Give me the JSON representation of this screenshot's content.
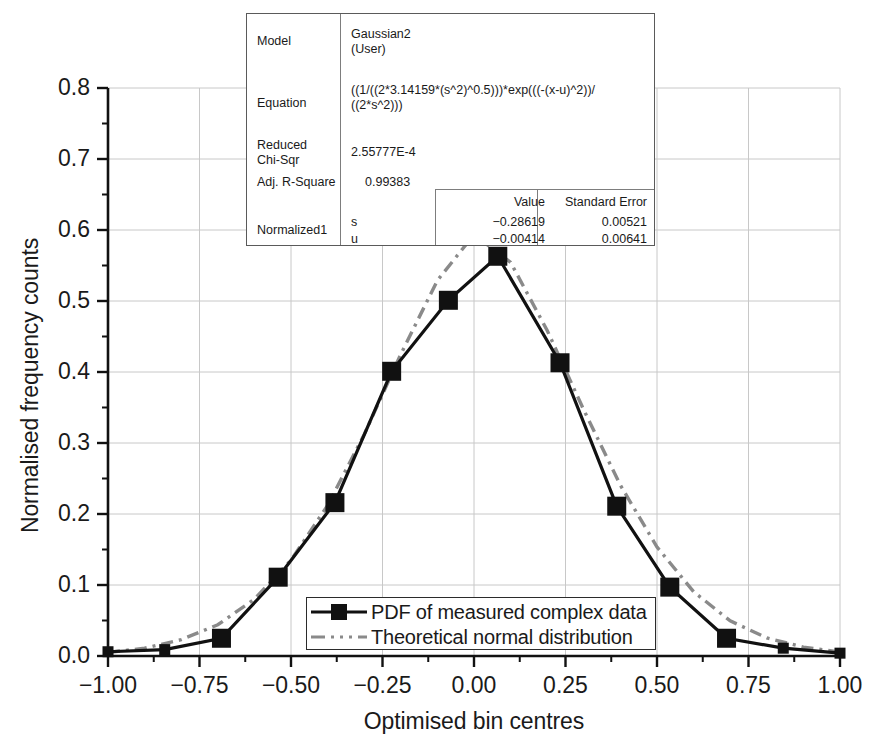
{
  "chart_data": {
    "type": "line",
    "title": "",
    "xlabel": "Optimised bin centres",
    "ylabel": "Normalised frequency counts",
    "xlim": [
      -1.0,
      1.0
    ],
    "ylim": [
      0.0,
      0.8
    ],
    "xticks": [
      "-1.00",
      "-0.75",
      "-0.50",
      "-0.25",
      "0.00",
      "0.25",
      "0.50",
      "0.75",
      "1.00"
    ],
    "xtick_values": [
      -1.0,
      -0.75,
      -0.5,
      -0.25,
      0.0,
      0.25,
      0.5,
      0.75,
      1.0
    ],
    "yticks": [
      "0.0",
      "0.1",
      "0.2",
      "0.3",
      "0.4",
      "0.5",
      "0.6",
      "0.7",
      "0.8"
    ],
    "ytick_values": [
      0.0,
      0.1,
      0.2,
      0.3,
      0.4,
      0.5,
      0.6,
      0.7,
      0.8
    ],
    "minor_ticks": true,
    "grid": true,
    "grid_color": "#c8c8c8",
    "legend_position": "lower center",
    "series": [
      {
        "name": "PDF of measured complex data",
        "style": "solid-line-with-square-markers",
        "color": "#111111",
        "x": [
          -1.0,
          -0.845,
          -0.69,
          -0.535,
          -0.38,
          -0.225,
          -0.07,
          0.065,
          0.235,
          0.39,
          0.535,
          0.69,
          0.845,
          1.0
        ],
        "y": [
          0.006,
          0.009,
          0.025,
          0.111,
          0.216,
          0.401,
          0.501,
          0.563,
          0.413,
          0.211,
          0.097,
          0.025,
          0.011,
          0.004
        ]
      },
      {
        "name": "Theoretical normal distribution",
        "style": "dash-dot-line",
        "color": "#8a8a8a",
        "x": [
          -1.0,
          -0.9,
          -0.8,
          -0.7,
          -0.6,
          -0.5,
          -0.4,
          -0.3,
          -0.2,
          -0.1,
          0.0,
          0.1,
          0.2,
          0.3,
          0.4,
          0.5,
          0.6,
          0.7,
          0.8,
          0.9,
          1.0
        ],
        "y": [
          0.005,
          0.011,
          0.023,
          0.044,
          0.08,
          0.135,
          0.212,
          0.312,
          0.425,
          0.529,
          0.5935,
          0.5545,
          0.4585,
          0.3465,
          0.2405,
          0.1535,
          0.0905,
          0.0495,
          0.0255,
          0.0125,
          0.0055
        ]
      }
    ],
    "fit_box": {
      "rows": [
        {
          "label": "Model",
          "value": "Gaussian2\n(User)"
        },
        {
          "label": "Equation",
          "value": "((1/((2*3.14159*(s^2)^0.5)))*exp(((-(x-u)^2))/\n((2*s^2)))"
        },
        {
          "label": "Reduced\nChi-Sqr",
          "value": "2.55777E-4"
        },
        {
          "label": "Adj. R-Square",
          "value": "0.99383"
        }
      ],
      "param_header": {
        "value_label": "Value",
        "error_label": "Standard Error"
      },
      "param_group": "Normalized1",
      "params": [
        {
          "name": "s",
          "value": "−0.28619",
          "error": "0.00521"
        },
        {
          "name": "u",
          "value": "−0.00414",
          "error": "0.00641"
        }
      ]
    }
  }
}
